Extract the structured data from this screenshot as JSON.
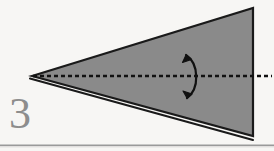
{
  "figure": {
    "label": "3",
    "caption_rule": "",
    "background_color": "#f7f6f4",
    "shape_fill_color": "#8a8a8a",
    "outline_color": "#1a1a1a",
    "label_color": "#8d8d8d",
    "rule_color": "#9a9a9a",
    "dashed_axis_color": "#111111"
  },
  "shapes": {
    "cone": {
      "name": "cone-triangle",
      "description": "gray filled triangle, apex at left, vertical base at right",
      "apex": [
        32,
        76
      ],
      "top_right": [
        253,
        8
      ],
      "bottom_right": [
        253,
        136
      ],
      "points": "32,76 253,8 253,136"
    },
    "lower_edge_line": {
      "name": "cone-lower-outline",
      "description": "second outline below lower edge forming thin white sliver at apex",
      "from": [
        30,
        78
      ],
      "to": [
        253,
        140
      ]
    },
    "axis": {
      "name": "rotation-axis",
      "description": "horizontal dashed line through cone from apex to base",
      "y": 76,
      "x_start": 33,
      "x_end": 272,
      "dash": "4 3"
    },
    "rotation_arrow": {
      "name": "rotation-arrow",
      "description": "curved double-headed arrow crossing the axis, bulging right",
      "path": "M 186,54 C 199,64 199,90 187,99",
      "arrowhead_top": [
        186,
        52
      ],
      "arrowhead_bottom": [
        186,
        100
      ]
    },
    "bottom_rule": {
      "name": "bottom-separator-rule",
      "y": 145,
      "x_start": 0,
      "x_end": 274
    }
  }
}
